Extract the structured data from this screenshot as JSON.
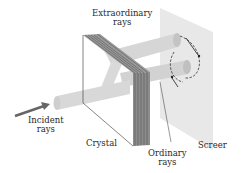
{
  "diagram": {
    "labels": {
      "extraordinary_line1": "Extraordinary",
      "extraordinary_line2": "rays",
      "incident_line1": "Incident",
      "incident_line2": "rays",
      "crystal": "Crystal",
      "ordinary_line1": "Ordinary",
      "ordinary_line2": "rays",
      "screen": "Screer"
    },
    "colors": {
      "beam": "#d0d0d0",
      "beam_end": "#b8b8b8",
      "screen": "#e6e6e6",
      "arrow": "#666666",
      "crystal_stripes": "#555555"
    }
  }
}
